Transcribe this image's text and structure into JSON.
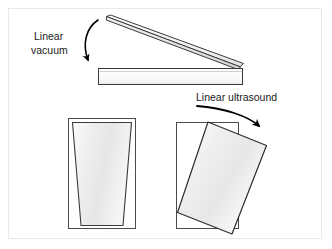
{
  "figure": {
    "background_color": "#ffffff",
    "border_color": "#e9e9e9",
    "stroke_color": "#3a3a3a",
    "fill_light": "#ffffff",
    "fill_shade": "#e6e6e6"
  },
  "labels": {
    "vacuum_line1": "Linear",
    "vacuum_line2": "vacuum",
    "ultrasound": "Linear ultrasound"
  },
  "diagram": {
    "top_panel": {
      "tilted_bar_name": "tilted-bar",
      "flat_bar_name": "flat-bar"
    },
    "bottom_left": {
      "frame_name": "left-frame",
      "shape_name": "trapezoid-cup"
    },
    "bottom_right": {
      "frame_name": "right-frame",
      "shape_name": "rotated-rectangle"
    }
  },
  "arrows": {
    "vacuum_arrow": "curved-arrow-down",
    "ultrasound_arrow": "curved-arrow-down-right"
  }
}
